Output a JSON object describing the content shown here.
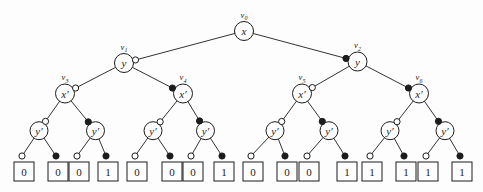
{
  "figure": {
    "type": "binary-decision-tree",
    "colors": {
      "background": "#fdfdfd",
      "ink": "#1c1c1c",
      "node_fill": "#fdfdfd"
    },
    "marker_legend": {
      "low_branch": "open-dot",
      "high_branch": "filled-dot"
    },
    "leaf_box": {
      "w": 20,
      "h": 19,
      "top": 162,
      "dot_y": 156
    },
    "nodes": [
      {
        "id": "v0",
        "label": "x",
        "tag": "v",
        "tag_sub": "0",
        "x": 244,
        "y": 31,
        "r": 9.5
      },
      {
        "id": "v1",
        "label": "y",
        "tag": "v",
        "tag_sub": "1",
        "x": 124,
        "y": 63,
        "r": 9.5
      },
      {
        "id": "v2",
        "label": "y",
        "tag": "v",
        "tag_sub": "2",
        "x": 357.5,
        "y": 61.5,
        "r": 9.5
      },
      {
        "id": "v3",
        "label": "x′",
        "tag": "v",
        "tag_sub": "3",
        "x": 65,
        "y": 93.5,
        "r": 9.5
      },
      {
        "id": "v4",
        "label": "x′",
        "tag": "v",
        "tag_sub": "4",
        "x": 183,
        "y": 93.5,
        "r": 9.5
      },
      {
        "id": "v5",
        "label": "x′",
        "tag": "v",
        "tag_sub": "5",
        "x": 302,
        "y": 93.5,
        "r": 9.5
      },
      {
        "id": "v6",
        "label": "x′",
        "tag": "v",
        "tag_sub": "6",
        "x": 419,
        "y": 93.5,
        "r": 9.5
      },
      {
        "id": "y1",
        "label": "y′",
        "x": 39,
        "y": 130.7,
        "r": 9
      },
      {
        "id": "y2",
        "label": "y′",
        "x": 95.5,
        "y": 130.7,
        "r": 9
      },
      {
        "id": "y3",
        "label": "y′",
        "x": 153,
        "y": 130.7,
        "r": 9
      },
      {
        "id": "y4",
        "label": "y′",
        "x": 205.5,
        "y": 130.7,
        "r": 9
      },
      {
        "id": "y5",
        "label": "y′",
        "x": 275,
        "y": 130.7,
        "r": 9
      },
      {
        "id": "y6",
        "label": "y′",
        "x": 329,
        "y": 130.7,
        "r": 9
      },
      {
        "id": "y7",
        "label": "y′",
        "x": 390,
        "y": 130.7,
        "r": 9
      },
      {
        "id": "y8",
        "label": "y′",
        "x": 445,
        "y": 130.7,
        "r": 9
      }
    ],
    "leaves": [
      {
        "id": "t0",
        "value": "0",
        "x": 24
      },
      {
        "id": "t1",
        "value": "0",
        "x": 58
      },
      {
        "id": "t2",
        "value": "0",
        "x": 79
      },
      {
        "id": "t3",
        "value": "1",
        "x": 108
      },
      {
        "id": "t4",
        "value": "0",
        "x": 137
      },
      {
        "id": "t5",
        "value": "0",
        "x": 172
      },
      {
        "id": "t6",
        "value": "0",
        "x": 193
      },
      {
        "id": "t7",
        "value": "1",
        "x": 224
      },
      {
        "id": "t8",
        "value": "0",
        "x": 253
      },
      {
        "id": "t9",
        "value": "0",
        "x": 287
      },
      {
        "id": "t10",
        "value": "0",
        "x": 309
      },
      {
        "id": "t11",
        "value": "1",
        "x": 347
      },
      {
        "id": "t12",
        "value": "1",
        "x": 372
      },
      {
        "id": "t13",
        "value": "1",
        "x": 406
      },
      {
        "id": "t14",
        "value": "1",
        "x": 428
      },
      {
        "id": "t15",
        "value": "1",
        "x": 462
      }
    ],
    "edges": [
      {
        "from": "v0",
        "to": "v1",
        "type": "low"
      },
      {
        "from": "v0",
        "to": "v2",
        "type": "high"
      },
      {
        "from": "v1",
        "to": "v3",
        "type": "low"
      },
      {
        "from": "v1",
        "to": "v4",
        "type": "high"
      },
      {
        "from": "v2",
        "to": "v5",
        "type": "low"
      },
      {
        "from": "v2",
        "to": "v6",
        "type": "high"
      },
      {
        "from": "v3",
        "to": "y1",
        "type": "low"
      },
      {
        "from": "v3",
        "to": "y2",
        "type": "high"
      },
      {
        "from": "v4",
        "to": "y3",
        "type": "low"
      },
      {
        "from": "v4",
        "to": "y4",
        "type": "high"
      },
      {
        "from": "v5",
        "to": "y5",
        "type": "low"
      },
      {
        "from": "v5",
        "to": "y6",
        "type": "high"
      },
      {
        "from": "v6",
        "to": "y7",
        "type": "low"
      },
      {
        "from": "v6",
        "to": "y8",
        "type": "high"
      },
      {
        "from": "y1",
        "to": "t0",
        "type": "low"
      },
      {
        "from": "y1",
        "to": "t1",
        "type": "high"
      },
      {
        "from": "y2",
        "to": "t2",
        "type": "low"
      },
      {
        "from": "y2",
        "to": "t3",
        "type": "high"
      },
      {
        "from": "y3",
        "to": "t4",
        "type": "low"
      },
      {
        "from": "y3",
        "to": "t5",
        "type": "high"
      },
      {
        "from": "y4",
        "to": "t6",
        "type": "low"
      },
      {
        "from": "y4",
        "to": "t7",
        "type": "high"
      },
      {
        "from": "y5",
        "to": "t8",
        "type": "low"
      },
      {
        "from": "y5",
        "to": "t9",
        "type": "high"
      },
      {
        "from": "y6",
        "to": "t10",
        "type": "low"
      },
      {
        "from": "y6",
        "to": "t11",
        "type": "high"
      },
      {
        "from": "y7",
        "to": "t12",
        "type": "low"
      },
      {
        "from": "y7",
        "to": "t13",
        "type": "high"
      },
      {
        "from": "y8",
        "to": "t14",
        "type": "low"
      },
      {
        "from": "y8",
        "to": "t15",
        "type": "high"
      }
    ]
  }
}
